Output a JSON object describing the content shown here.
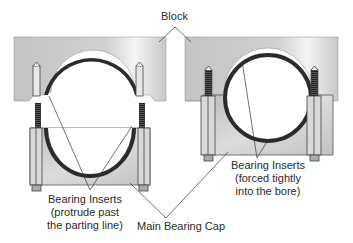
{
  "diagram": {
    "labels": {
      "block": "Block",
      "left_inserts": [
        "Bearing Inserts",
        "(protrude past",
        "the parting line)"
      ],
      "right_inserts": [
        "Bearing Inserts",
        "(forced tightly",
        "into the bore)"
      ],
      "cap": "Main Bearing Cap"
    },
    "panels": [
      {
        "name": "left",
        "state": "cap removed, inserts protrude past parting line"
      },
      {
        "name": "right",
        "state": "cap installed, inserts forced tightly into bore"
      }
    ],
    "colors": {
      "block": "#c8c8c8",
      "insert": "#2b2b2b",
      "line": "#333333",
      "text": "#2a2a2a"
    }
  }
}
